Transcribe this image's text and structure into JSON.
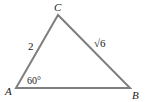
{
  "diagram": {
    "type": "triangle",
    "line_color": "#7f7f7f",
    "vertices": {
      "A": {
        "label": "A",
        "x": 16,
        "y": 88
      },
      "B": {
        "label": "B",
        "x": 130,
        "y": 88
      },
      "C": {
        "label": "C",
        "x": 58,
        "y": 15
      }
    },
    "sides": {
      "AC": {
        "label": "2"
      },
      "BC": {
        "label": "√6"
      }
    },
    "angles": {
      "A": {
        "label": "60°"
      }
    }
  }
}
